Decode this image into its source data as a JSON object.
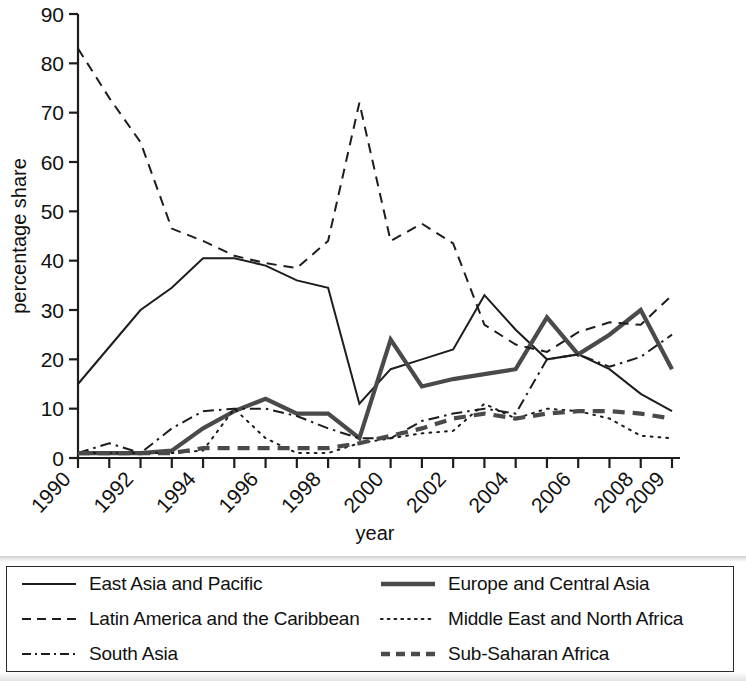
{
  "chart_data": {
    "type": "line",
    "title": "",
    "xlabel": "year",
    "ylabel": "percentage share",
    "xlim": [
      1990,
      2009
    ],
    "ylim": [
      0,
      90
    ],
    "ytick_values": [
      0,
      10,
      20,
      30,
      40,
      50,
      60,
      70,
      80,
      90
    ],
    "xtick_labels": [
      "1990",
      "1992",
      "1994",
      "1996",
      "1998",
      "2000",
      "2002",
      "2004",
      "2006",
      "2008",
      "2009"
    ],
    "x": [
      1990,
      1991,
      1992,
      1993,
      1994,
      1995,
      1996,
      1997,
      1998,
      1999,
      2000,
      2001,
      2002,
      2003,
      2004,
      2005,
      2006,
      2007,
      2008,
      2009
    ],
    "grid": false,
    "legend_position": "below-plot",
    "series": [
      {
        "name": "East Asia and Pacific",
        "style": "solid",
        "color": "#1d1d1d",
        "width": 2.0,
        "values": [
          15,
          22.5,
          30,
          34.5,
          40.5,
          40.5,
          39,
          36,
          34.5,
          11,
          18,
          20,
          22,
          33,
          26,
          20,
          21,
          18,
          13,
          9.5
        ]
      },
      {
        "name": "Europe and Central Asia",
        "style": "solid",
        "color": "#4a4a4a",
        "width": 4.2,
        "values": [
          1,
          1,
          1,
          1.5,
          6,
          9.5,
          12,
          9,
          9,
          4,
          24,
          14.5,
          16,
          17,
          18,
          28.5,
          21,
          25,
          30,
          18
        ]
      },
      {
        "name": "Latin America and the Caribbean",
        "style": "dashed",
        "color": "#1d1d1d",
        "width": 2.0,
        "values": [
          83,
          73,
          64,
          46.5,
          44,
          41,
          39.5,
          38.5,
          44,
          72,
          44,
          47.5,
          43.5,
          27,
          23,
          21.5,
          25.5,
          27.5,
          27,
          33
        ]
      },
      {
        "name": "Middle East and North Africa",
        "style": "dotted",
        "color": "#1d1d1d",
        "width": 2.0,
        "values": [
          1,
          1,
          1,
          1,
          1.5,
          10,
          4,
          1,
          1,
          3,
          4,
          5,
          5.5,
          11,
          8,
          10,
          9.5,
          8,
          4.5,
          4
        ]
      },
      {
        "name": "South Asia",
        "style": "dashdot",
        "color": "#1d1d1d",
        "width": 2.0,
        "values": [
          1,
          3,
          1,
          6,
          9.5,
          10,
          10,
          8.5,
          6,
          4,
          4,
          7.5,
          9,
          10,
          9,
          20,
          21,
          18.5,
          20.5,
          25
        ]
      },
      {
        "name": "Sub-Saharan Africa",
        "style": "dashed-thick",
        "color": "#4a4a4a",
        "width": 4.2,
        "values": [
          1,
          1,
          1,
          1,
          2,
          2,
          2,
          2,
          2,
          3,
          4.5,
          6,
          8,
          9,
          8,
          9,
          9.5,
          9.5,
          9,
          8
        ]
      }
    ]
  },
  "legend": {
    "items": [
      {
        "label": "East Asia and Pacific",
        "icon": "solid-line-icon"
      },
      {
        "label": "Europe and Central Asia",
        "icon": "thick-solid-line-icon"
      },
      {
        "label": "Latin America and the Caribbean",
        "icon": "dashed-line-icon"
      },
      {
        "label": "Middle East and North Africa",
        "icon": "dotted-line-icon"
      },
      {
        "label": "South Asia",
        "icon": "dash-dot-line-icon"
      },
      {
        "label": "Sub-Saharan Africa",
        "icon": "thick-dashed-line-icon"
      }
    ]
  }
}
